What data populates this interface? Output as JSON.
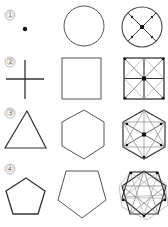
{
  "colors": {
    "stroke": "#444444",
    "light": "#999999",
    "dot": "#111111",
    "label": "#777777"
  },
  "rows": [
    {
      "label": "①",
      "col1": "point",
      "col2": "circle",
      "col3": "circle-with-diagonals"
    },
    {
      "label": "②",
      "col1": "cross",
      "col2": "square",
      "col3": "square-with-grid-and-diagonals"
    },
    {
      "label": "③",
      "col1": "triangle",
      "col2": "hexagon",
      "col3": "hexagon-with-star-lines"
    },
    {
      "label": "④",
      "col1": "pentagon",
      "col2": "inverted-pentagon",
      "col3": "decagon-star"
    }
  ]
}
